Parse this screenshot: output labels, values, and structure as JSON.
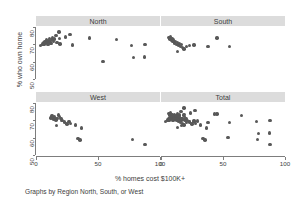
{
  "figure": {
    "ylabel": "% who own home",
    "xlabel": "% homes cost $100K+",
    "caption": "Graphs by Region North, South, or West",
    "marker_color": "#585858",
    "strip_color": "#dcdcdc",
    "axis_color": "#7d7d7d",
    "background": "#ffffff"
  },
  "chart_data": {
    "type": "scatter",
    "title": "",
    "xlabel": "% homes cost $100K+",
    "ylabel": "% who own home",
    "caption": "Graphs by Region North, South, or West",
    "xlim": [
      0,
      100
    ],
    "ylim": [
      50,
      80
    ],
    "xticks": [
      0,
      50,
      100
    ],
    "yticks": [
      50,
      60,
      70,
      80
    ],
    "xtick_labels": [
      "0",
      "50",
      "100"
    ],
    "ytick_labels": [
      "50",
      "60",
      "70",
      "80"
    ],
    "grid": false,
    "legend": "none",
    "layout": "2x2 panel grid by region",
    "panels": [
      {
        "name": "North",
        "row": 0,
        "col": 0,
        "points": [
          {
            "x": 3.5,
            "y": 69.3
          },
          {
            "x": 5.0,
            "y": 70.2
          },
          {
            "x": 5.8,
            "y": 71.0
          },
          {
            "x": 6.5,
            "y": 69.8
          },
          {
            "x": 7.2,
            "y": 71.6
          },
          {
            "x": 7.8,
            "y": 70.6
          },
          {
            "x": 8.4,
            "y": 72.4
          },
          {
            "x": 9.0,
            "y": 71.2
          },
          {
            "x": 9.6,
            "y": 70.0
          },
          {
            "x": 10.2,
            "y": 72.0
          },
          {
            "x": 10.8,
            "y": 73.2
          },
          {
            "x": 11.4,
            "y": 71.4
          },
          {
            "x": 12.0,
            "y": 70.4
          },
          {
            "x": 12.8,
            "y": 72.8
          },
          {
            "x": 13.5,
            "y": 74.0
          },
          {
            "x": 14.2,
            "y": 71.8
          },
          {
            "x": 15.0,
            "y": 73.0
          },
          {
            "x": 16.0,
            "y": 75.0
          },
          {
            "x": 17.0,
            "y": 71.0
          },
          {
            "x": 18.5,
            "y": 77.2
          },
          {
            "x": 19.0,
            "y": 73.4
          },
          {
            "x": 19.5,
            "y": 70.2
          },
          {
            "x": 24.0,
            "y": 74.2
          },
          {
            "x": 27.5,
            "y": 75.6
          },
          {
            "x": 29.5,
            "y": 69.6
          },
          {
            "x": 43.0,
            "y": 73.6
          },
          {
            "x": 54.0,
            "y": 60.2
          },
          {
            "x": 65.0,
            "y": 72.8
          },
          {
            "x": 77.0,
            "y": 69.2
          },
          {
            "x": 78.5,
            "y": 62.4
          },
          {
            "x": 88.0,
            "y": 69.8
          },
          {
            "x": 87.5,
            "y": 62.8
          }
        ]
      },
      {
        "name": "South",
        "row": 0,
        "col": 1,
        "points": [
          {
            "x": 6.5,
            "y": 74.0
          },
          {
            "x": 7.2,
            "y": 73.0
          },
          {
            "x": 7.8,
            "y": 74.4
          },
          {
            "x": 8.4,
            "y": 72.2
          },
          {
            "x": 9.0,
            "y": 73.4
          },
          {
            "x": 9.6,
            "y": 71.6
          },
          {
            "x": 10.2,
            "y": 72.6
          },
          {
            "x": 11.0,
            "y": 70.8
          },
          {
            "x": 11.8,
            "y": 71.8
          },
          {
            "x": 12.5,
            "y": 70.0
          },
          {
            "x": 13.2,
            "y": 71.0
          },
          {
            "x": 14.0,
            "y": 69.6
          },
          {
            "x": 14.8,
            "y": 70.6
          },
          {
            "x": 15.6,
            "y": 68.8
          },
          {
            "x": 16.5,
            "y": 69.8
          },
          {
            "x": 17.5,
            "y": 68.2
          },
          {
            "x": 18.5,
            "y": 67.4
          },
          {
            "x": 13.5,
            "y": 66.0
          },
          {
            "x": 20.5,
            "y": 68.6
          },
          {
            "x": 23.0,
            "y": 69.4
          },
          {
            "x": 26.5,
            "y": 69.6
          },
          {
            "x": 38.0,
            "y": 68.6
          },
          {
            "x": 45.0,
            "y": 73.6
          },
          {
            "x": 55.0,
            "y": 68.8
          }
        ]
      },
      {
        "name": "West",
        "row": 1,
        "col": 0,
        "points": [
          {
            "x": 12.0,
            "y": 71.4
          },
          {
            "x": 13.0,
            "y": 72.6
          },
          {
            "x": 14.0,
            "y": 70.8
          },
          {
            "x": 15.0,
            "y": 72.0
          },
          {
            "x": 16.0,
            "y": 70.2
          },
          {
            "x": 17.0,
            "y": 71.0
          },
          {
            "x": 18.0,
            "y": 73.0
          },
          {
            "x": 19.0,
            "y": 72.2
          },
          {
            "x": 20.0,
            "y": 71.2
          },
          {
            "x": 16.5,
            "y": 67.0
          },
          {
            "x": 21.0,
            "y": 70.0
          },
          {
            "x": 23.0,
            "y": 69.0
          },
          {
            "x": 25.0,
            "y": 68.0
          },
          {
            "x": 26.5,
            "y": 69.4
          },
          {
            "x": 28.0,
            "y": 68.2
          },
          {
            "x": 32.0,
            "y": 67.2
          },
          {
            "x": 34.0,
            "y": 59.6
          },
          {
            "x": 35.5,
            "y": 58.6
          },
          {
            "x": 36.5,
            "y": 65.6
          },
          {
            "x": 78.0,
            "y": 58.8
          },
          {
            "x": 88.0,
            "y": 56.0
          }
        ]
      },
      {
        "name": "Total",
        "row": 1,
        "col": 1,
        "points": [
          {
            "x": 3.5,
            "y": 69.3
          },
          {
            "x": 5.0,
            "y": 70.2
          },
          {
            "x": 5.8,
            "y": 71.0
          },
          {
            "x": 6.5,
            "y": 69.8
          },
          {
            "x": 7.2,
            "y": 71.6
          },
          {
            "x": 7.8,
            "y": 70.6
          },
          {
            "x": 8.4,
            "y": 72.4
          },
          {
            "x": 9.0,
            "y": 71.2
          },
          {
            "x": 9.6,
            "y": 70.0
          },
          {
            "x": 10.2,
            "y": 72.0
          },
          {
            "x": 10.8,
            "y": 73.2
          },
          {
            "x": 11.4,
            "y": 71.4
          },
          {
            "x": 12.0,
            "y": 70.4
          },
          {
            "x": 12.8,
            "y": 72.8
          },
          {
            "x": 13.5,
            "y": 74.0
          },
          {
            "x": 14.2,
            "y": 71.8
          },
          {
            "x": 15.0,
            "y": 73.0
          },
          {
            "x": 16.0,
            "y": 75.0
          },
          {
            "x": 17.0,
            "y": 71.0
          },
          {
            "x": 18.5,
            "y": 77.2
          },
          {
            "x": 19.0,
            "y": 73.4
          },
          {
            "x": 19.5,
            "y": 70.2
          },
          {
            "x": 24.0,
            "y": 74.2
          },
          {
            "x": 27.5,
            "y": 75.6
          },
          {
            "x": 29.5,
            "y": 69.6
          },
          {
            "x": 43.0,
            "y": 73.6
          },
          {
            "x": 54.0,
            "y": 60.2
          },
          {
            "x": 65.0,
            "y": 72.8
          },
          {
            "x": 77.0,
            "y": 69.2
          },
          {
            "x": 78.5,
            "y": 62.4
          },
          {
            "x": 88.0,
            "y": 69.8
          },
          {
            "x": 87.5,
            "y": 62.8
          },
          {
            "x": 6.5,
            "y": 74.0
          },
          {
            "x": 7.2,
            "y": 73.0
          },
          {
            "x": 7.8,
            "y": 74.4
          },
          {
            "x": 8.4,
            "y": 72.2
          },
          {
            "x": 9.0,
            "y": 73.4
          },
          {
            "x": 9.6,
            "y": 71.6
          },
          {
            "x": 10.2,
            "y": 72.6
          },
          {
            "x": 11.0,
            "y": 70.8
          },
          {
            "x": 11.8,
            "y": 71.8
          },
          {
            "x": 12.5,
            "y": 70.0
          },
          {
            "x": 13.2,
            "y": 71.0
          },
          {
            "x": 14.0,
            "y": 69.6
          },
          {
            "x": 14.8,
            "y": 70.6
          },
          {
            "x": 15.6,
            "y": 68.8
          },
          {
            "x": 16.5,
            "y": 69.8
          },
          {
            "x": 17.5,
            "y": 68.2
          },
          {
            "x": 18.5,
            "y": 67.4
          },
          {
            "x": 13.5,
            "y": 66.0
          },
          {
            "x": 20.5,
            "y": 68.6
          },
          {
            "x": 23.0,
            "y": 69.4
          },
          {
            "x": 26.5,
            "y": 69.6
          },
          {
            "x": 38.0,
            "y": 68.6
          },
          {
            "x": 45.0,
            "y": 73.6
          },
          {
            "x": 55.0,
            "y": 68.8
          },
          {
            "x": 12.0,
            "y": 71.4
          },
          {
            "x": 13.0,
            "y": 72.6
          },
          {
            "x": 14.0,
            "y": 70.8
          },
          {
            "x": 15.0,
            "y": 72.0
          },
          {
            "x": 16.0,
            "y": 70.2
          },
          {
            "x": 17.0,
            "y": 71.0
          },
          {
            "x": 18.0,
            "y": 73.0
          },
          {
            "x": 19.0,
            "y": 72.2
          },
          {
            "x": 20.0,
            "y": 71.2
          },
          {
            "x": 16.5,
            "y": 67.0
          },
          {
            "x": 21.0,
            "y": 70.0
          },
          {
            "x": 23.0,
            "y": 69.0
          },
          {
            "x": 25.0,
            "y": 68.0
          },
          {
            "x": 26.5,
            "y": 69.4
          },
          {
            "x": 28.0,
            "y": 68.2
          },
          {
            "x": 32.0,
            "y": 67.2
          },
          {
            "x": 34.0,
            "y": 59.6
          },
          {
            "x": 35.5,
            "y": 58.6
          },
          {
            "x": 36.5,
            "y": 65.6
          },
          {
            "x": 78.0,
            "y": 58.8
          },
          {
            "x": 88.0,
            "y": 56.0
          }
        ]
      }
    ]
  }
}
